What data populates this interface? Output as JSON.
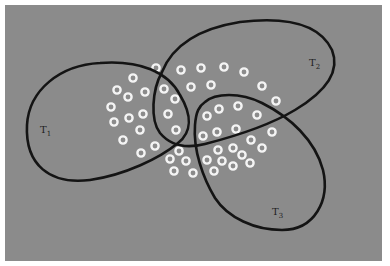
{
  "diagram": {
    "background_color": "#8b8b8b",
    "curve_color": "#141414",
    "dot_color": "#f4f4f4",
    "sets": [
      {
        "name": "T1",
        "base": "T",
        "sub": "1",
        "label_x": 40,
        "label_y": 124
      },
      {
        "name": "T2",
        "base": "T",
        "sub": "2",
        "label_x": 309,
        "label_y": 57
      },
      {
        "name": "T3",
        "base": "T",
        "sub": "3",
        "label_x": 272,
        "label_y": 207
      }
    ],
    "points": [
      [
        156,
        68
      ],
      [
        181,
        70
      ],
      [
        201,
        68
      ],
      [
        224,
        67
      ],
      [
        244,
        72
      ],
      [
        133,
        78
      ],
      [
        191,
        87
      ],
      [
        211,
        85
      ],
      [
        262,
        86
      ],
      [
        117,
        90
      ],
      [
        145,
        92
      ],
      [
        164,
        89
      ],
      [
        128,
        97
      ],
      [
        175,
        99
      ],
      [
        276,
        101
      ],
      [
        111,
        107
      ],
      [
        219,
        109
      ],
      [
        238,
        106
      ],
      [
        129,
        118
      ],
      [
        143,
        114
      ],
      [
        168,
        114
      ],
      [
        207,
        116
      ],
      [
        257,
        115
      ],
      [
        114,
        122
      ],
      [
        140,
        130
      ],
      [
        176,
        130
      ],
      [
        217,
        132
      ],
      [
        236,
        129
      ],
      [
        272,
        132
      ],
      [
        123,
        140
      ],
      [
        203,
        136
      ],
      [
        155,
        146
      ],
      [
        251,
        140
      ],
      [
        141,
        153
      ],
      [
        179,
        151
      ],
      [
        218,
        150
      ],
      [
        233,
        148
      ],
      [
        262,
        148
      ],
      [
        170,
        159
      ],
      [
        186,
        161
      ],
      [
        207,
        160
      ],
      [
        222,
        161
      ],
      [
        242,
        155
      ],
      [
        250,
        163
      ],
      [
        174,
        171
      ],
      [
        193,
        173
      ],
      [
        214,
        171
      ],
      [
        233,
        166
      ]
    ]
  }
}
